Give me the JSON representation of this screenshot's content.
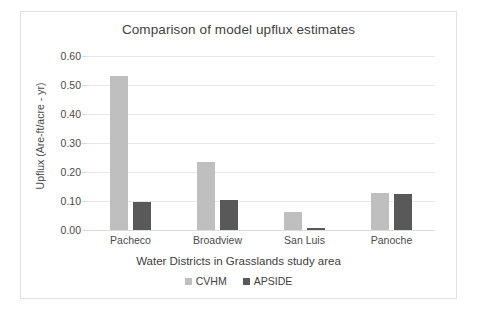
{
  "chart_data": {
    "type": "bar",
    "title": "Comparison of model upflux estimates",
    "xlabel": "Water Districts in Grasslands study area",
    "ylabel": "Upflux (Are-ft/acre - yr)",
    "categories": [
      "Pacheco",
      "Broadview",
      "San Luis",
      "Panoche"
    ],
    "series": [
      {
        "name": "CVHM",
        "color": "#bfbfbf",
        "values": [
          0.53,
          0.234,
          0.062,
          0.128
        ]
      },
      {
        "name": "APSIDE",
        "color": "#595959",
        "values": [
          0.098,
          0.103,
          0.008,
          0.123
        ]
      }
    ],
    "ylim": [
      0.0,
      0.6
    ],
    "yticks": [
      "0.00",
      "0.10",
      "0.20",
      "0.30",
      "0.40",
      "0.50",
      "0.60"
    ],
    "ytick_values": [
      0.0,
      0.1,
      0.2,
      0.3,
      0.4,
      0.5,
      0.6
    ],
    "grid": true,
    "legend_position": "bottom"
  }
}
